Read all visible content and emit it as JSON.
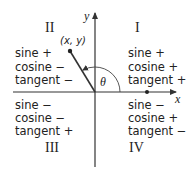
{
  "axes": {
    "x_label": "x",
    "y_label": "y"
  },
  "point": {
    "label": "(x, y)"
  },
  "angle": {
    "label": "θ"
  },
  "quadrants": {
    "I": {
      "numeral": "I",
      "lines": [
        "sine +",
        "cosine +",
        "tangent +"
      ]
    },
    "II": {
      "numeral": "II",
      "lines": [
        "sine +",
        "cosine −",
        "tangent −"
      ]
    },
    "III": {
      "numeral": "III",
      "lines": [
        "sine −",
        "cosine −",
        "tangent +"
      ]
    },
    "IV": {
      "numeral": "IV",
      "lines": [
        "sine −",
        "cosine +",
        "tangent −"
      ]
    }
  },
  "colors": {
    "axis": "#333333",
    "text": "#222222",
    "background": "#ffffff"
  }
}
